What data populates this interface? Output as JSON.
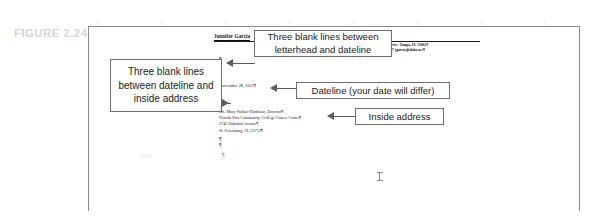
{
  "figure": {
    "label": "FIGURE 2.24"
  },
  "document": {
    "letterhead": {
      "name": "Jennifer Garcia",
      "address_line": "3-Bay Cliff Drive,·Tampa, FL 33602¶",
      "contact_line": "(727)-555-0047·jgarcia@aloha.net¶"
    },
    "dateline": "November 28, 2012¶",
    "inside_address": [
      "Ms. Mary Walker-Harbison, Director¶",
      "Florida Port Community·College·Career Center¶",
      "2745 Oakland Avenue¶",
      "St. Petersburg, FL 33713¶"
    ],
    "paragraph_mark": "¶"
  },
  "callouts": {
    "blank_lines_dateline_address": "Three blank lines between dateline and inside address",
    "blank_lines_letterhead_dateline": "Three blank lines between letterhead and dateline",
    "dateline_note": "Dateline (your date will differ)",
    "inside_address_note": "Inside address"
  }
}
